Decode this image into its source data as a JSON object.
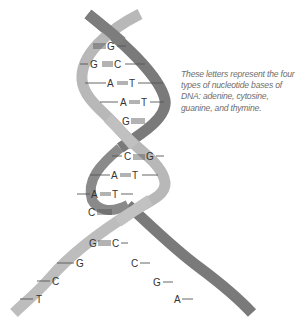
{
  "diagram": {
    "type": "DNA double helix",
    "caption": "These letters represent the four types of nucleotide bases of DNA: adenine, cytosine, guanine, and thymine.",
    "colors": {
      "strand_light": "#b8b8b8",
      "strand_dark": "#7a7a7a",
      "bond_line": "#555555",
      "base_text": "#333333",
      "caption_text": "#6e6e6e"
    },
    "base_pairs": [
      {
        "left": "",
        "right": "G",
        "bond": "triple"
      },
      {
        "left": "G",
        "right": "C",
        "bond": "triple"
      },
      {
        "left": "A",
        "right": "T",
        "bond": "double"
      },
      {
        "left": "A",
        "right": "T",
        "bond": "double"
      },
      {
        "left": "G",
        "right": "",
        "bond": "triple"
      },
      {
        "left": "C",
        "right": "G",
        "bond": "triple"
      },
      {
        "left": "A",
        "right": "T",
        "bond": "double"
      },
      {
        "left": "A",
        "right": "T",
        "bond": "double"
      },
      {
        "left": "C",
        "right": "",
        "bond": "triple"
      },
      {
        "left": "G",
        "right": "C",
        "bond": "triple"
      }
    ],
    "unpaired_left": [
      "G",
      "C",
      "T"
    ],
    "unpaired_right": [
      "C",
      "G",
      "A"
    ],
    "labels": {
      "bp0_r": "G",
      "bp1_l": "G",
      "bp1_r": "C",
      "bp2_l": "A",
      "bp2_r": "T",
      "bp3_l": "A",
      "bp3_r": "T",
      "bp4_l": "G",
      "bp5_l": "C",
      "bp5_r": "G",
      "bp6_l": "A",
      "bp6_r": "T",
      "bp7_l": "A",
      "bp7_r": "T",
      "bp8_l": "C",
      "bp9_l": "G",
      "bp9_r": "C",
      "ul0": "G",
      "ul1": "C",
      "ul2": "T",
      "ur0": "C",
      "ur1": "G",
      "ur2": "A"
    }
  }
}
